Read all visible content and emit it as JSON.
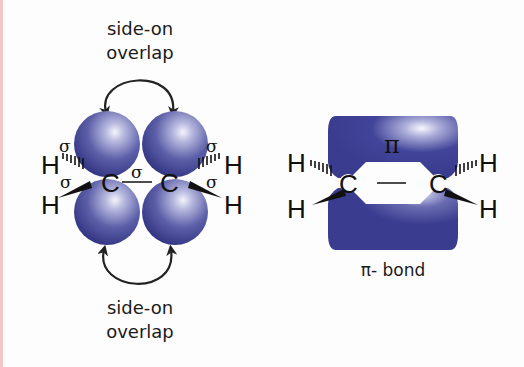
{
  "left_diagram": {
    "title": "sigma bonds with p-orbital side-on overlap",
    "top_label_line1": "side-on",
    "top_label_line2": "overlap",
    "bottom_label_line1": "side-on",
    "bottom_label_line2": "overlap",
    "atoms": {
      "carbon_left": "C",
      "carbon_right": "C",
      "h_top_left": "H",
      "h_bottom_left": "H",
      "h_top_right": "H",
      "h_bottom_right": "H"
    },
    "bond_labels": {
      "sigma_top_left": "σ",
      "sigma_bottom_left": "σ",
      "sigma_center": "σ",
      "sigma_top_right": "σ",
      "sigma_bottom_right": "σ"
    }
  },
  "right_diagram": {
    "pi_symbol": "π",
    "caption": "π- bond",
    "atoms": {
      "carbon_left": "C",
      "carbon_right": "C",
      "h_top_left": "H",
      "h_bottom_left": "H",
      "h_top_right": "H",
      "h_bottom_right": "H"
    }
  },
  "colors": {
    "orbital": "#3a3d8f",
    "orbital_highlight": "#e8e9f6",
    "edge": "#f0c8c8"
  }
}
